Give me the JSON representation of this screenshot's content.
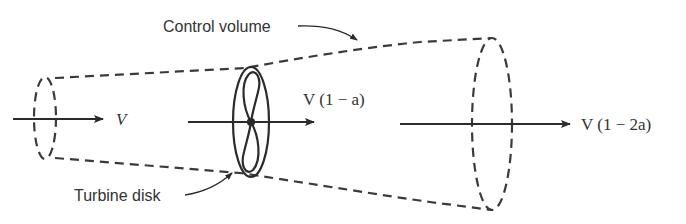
{
  "diagram": {
    "type": "actuator-disk stream tube",
    "labels": {
      "control_volume": "Control volume",
      "turbine_disk": "Turbine disk",
      "upstream_velocity": "V",
      "disk_velocity": "V (1 − a)",
      "wake_velocity": "V (1 − 2a)"
    },
    "colors": {
      "line": "#2b2b2b",
      "dash": "#3a3a3a",
      "text": "#333333",
      "background": "#ffffff"
    }
  }
}
